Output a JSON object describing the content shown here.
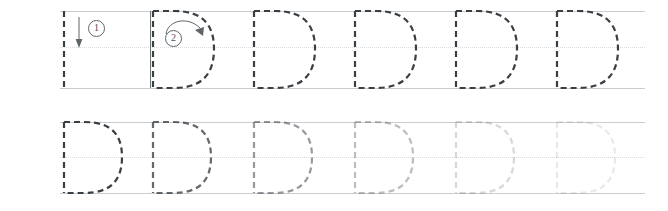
{
  "worksheet": {
    "letter": "D",
    "type": "handwriting-tracing-worksheet",
    "colors": {
      "guideline": "#c9cdd1",
      "midline_dotted": "#d9dde1",
      "stroke_dark": "#3a3f44",
      "divider": "#6d7276",
      "marker": "#5e6468"
    },
    "layout": {
      "rows": 2,
      "letters_per_row": 6,
      "cell_pitch_px": 101,
      "guide_left_px": 60,
      "guide_right_px": 645
    },
    "rows": [
      {
        "name": "demonstration-row",
        "top_px": 11,
        "mid_px": 47,
        "base_px": 88,
        "has_stroke_markers": true,
        "has_solid_divider": true,
        "divider_x_px": 150,
        "letters": [
          {
            "index": 1,
            "form": "stem-only",
            "opacity": 1.0
          },
          {
            "index": 2,
            "form": "full",
            "opacity": 1.0
          },
          {
            "index": 3,
            "form": "full",
            "opacity": 1.0
          },
          {
            "index": 4,
            "form": "full",
            "opacity": 1.0
          },
          {
            "index": 5,
            "form": "full",
            "opacity": 1.0
          },
          {
            "index": 6,
            "form": "full",
            "opacity": 1.0
          }
        ]
      },
      {
        "name": "practice-row",
        "top_px": 17,
        "mid_px": 52,
        "base_px": 88,
        "has_stroke_markers": false,
        "has_solid_divider": false,
        "letters": [
          {
            "index": 1,
            "form": "full",
            "opacity": 1.0
          },
          {
            "index": 2,
            "form": "full",
            "opacity": 0.78
          },
          {
            "index": 3,
            "form": "full",
            "opacity": 0.52
          },
          {
            "index": 4,
            "form": "full",
            "opacity": 0.34
          },
          {
            "index": 5,
            "form": "full",
            "opacity": 0.2
          },
          {
            "index": 6,
            "form": "full",
            "opacity": 0.11
          }
        ]
      }
    ],
    "stroke_markers": [
      {
        "order": "1",
        "label": "①",
        "direction": "down",
        "describes": "vertical stem drawn top to bottom",
        "cell_index": 1
      },
      {
        "order": "2",
        "label": "②",
        "direction": "clockwise-curve",
        "describes": "bowl curve drawn from topline around to baseline",
        "cell_index": 2
      }
    ]
  }
}
